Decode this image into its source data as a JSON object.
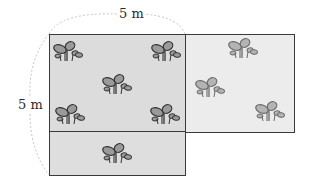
{
  "diagram": {
    "type": "garden-plot-area",
    "labels": {
      "top_width": "5 m",
      "left_height": "5 m"
    },
    "colors": {
      "left_plot_fill": "#dcdcdc",
      "right_plot_fill": "#ececec",
      "border": "#3a3a3a",
      "plant_fill": "#9a9a9a",
      "plant_stroke": "#333333",
      "dashed_arc": "#b8b8b8"
    },
    "regions": [
      {
        "name": "left-square-upper",
        "x": 49,
        "y": 34,
        "w": 136,
        "h": 98,
        "plants": 5
      },
      {
        "name": "left-strip-lower",
        "x": 49,
        "y": 132,
        "w": 136,
        "h": 43,
        "plants": 1
      },
      {
        "name": "right-plot",
        "x": 185,
        "y": 34,
        "w": 110,
        "h": 99,
        "plants": 3
      }
    ],
    "plants": [
      {
        "x": 52,
        "y": 40,
        "region": "left-square-upper"
      },
      {
        "x": 150,
        "y": 40,
        "region": "left-square-upper"
      },
      {
        "x": 101,
        "y": 73,
        "region": "left-square-upper"
      },
      {
        "x": 54,
        "y": 103,
        "region": "left-square-upper"
      },
      {
        "x": 149,
        "y": 103,
        "region": "left-square-upper"
      },
      {
        "x": 101,
        "y": 142,
        "region": "left-strip-lower"
      },
      {
        "x": 227,
        "y": 37,
        "region": "right-plot"
      },
      {
        "x": 194,
        "y": 76,
        "region": "right-plot"
      },
      {
        "x": 254,
        "y": 100,
        "region": "right-plot"
      }
    ]
  }
}
